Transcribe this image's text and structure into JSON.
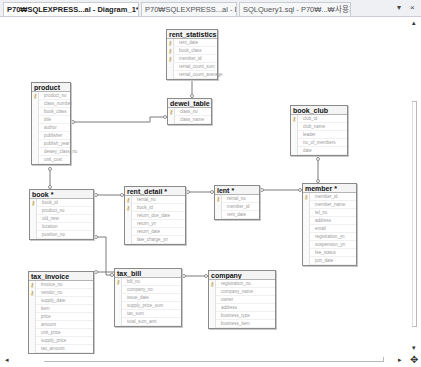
{
  "tabs": [
    {
      "label": "P70₩SQLEXPRESS...al - Diagram_1*",
      "active": true
    },
    {
      "label": "P70₩SQLEXPRESS...al - Diagram_0*",
      "active": false
    },
    {
      "label": "SQLQuery1.sql - P70₩...₩사용자...*",
      "active": false
    }
  ],
  "window_controls": {
    "dropdown": "▾",
    "close": "×"
  },
  "scrollbars": {
    "up": "▴",
    "left": "◂",
    "right": "▸",
    "down": "▾",
    "pan": "✥"
  },
  "colors": {
    "key": "#b8941e",
    "border": "#8a8a8a",
    "line": "#7a7a7a"
  },
  "tables": [
    {
      "name": "rent_statistics",
      "x": 166,
      "y": 29,
      "w": 52,
      "columns": [
        {
          "name": "rent_date",
          "key": true
        },
        {
          "name": "book_class",
          "key": true
        },
        {
          "name": "member_id",
          "key": true
        },
        {
          "name": "rental_count_sum",
          "key": false
        },
        {
          "name": "rental_count_average",
          "key": false
        }
      ]
    },
    {
      "name": "dewei_table",
      "x": 167,
      "y": 98,
      "w": 45,
      "columns": [
        {
          "name": "class_no",
          "key": true
        },
        {
          "name": "class_name",
          "key": false
        }
      ]
    },
    {
      "name": "product",
      "x": 31,
      "y": 82,
      "w": 40,
      "columns": [
        {
          "name": "product_no",
          "key": true
        },
        {
          "name": "class_number",
          "key": false
        },
        {
          "name": "book_class",
          "key": false
        },
        {
          "name": "title",
          "key": false
        },
        {
          "name": "author",
          "key": false
        },
        {
          "name": "publisher",
          "key": false
        },
        {
          "name": "publish_year",
          "key": false
        },
        {
          "name": "dewey_class_no",
          "key": false
        },
        {
          "name": "unit_cost",
          "key": false
        }
      ]
    },
    {
      "name": "book_club",
      "x": 290,
      "y": 105,
      "w": 58,
      "columns": [
        {
          "name": "club_id",
          "key": true
        },
        {
          "name": "club_name",
          "key": false
        },
        {
          "name": "leader",
          "key": false
        },
        {
          "name": "no_of_members",
          "key": false
        },
        {
          "name": "date",
          "key": false
        }
      ]
    },
    {
      "name": "book *",
      "x": 29,
      "y": 189,
      "w": 65,
      "columns": [
        {
          "name": "book_id",
          "key": true
        },
        {
          "name": "product_no",
          "key": false
        },
        {
          "name": "old_new",
          "key": false
        },
        {
          "name": "location",
          "key": false
        },
        {
          "name": "position_no",
          "key": false
        }
      ]
    },
    {
      "name": "rent_detail *",
      "x": 124,
      "y": 186,
      "w": 62,
      "columns": [
        {
          "name": "rental_no",
          "key": true
        },
        {
          "name": "book_id",
          "key": true
        },
        {
          "name": "return_due_date",
          "key": false
        },
        {
          "name": "return_yn",
          "key": false
        },
        {
          "name": "return_date",
          "key": false
        },
        {
          "name": "late_charge_yn",
          "key": false
        }
      ]
    },
    {
      "name": "lent *",
      "x": 214,
      "y": 185,
      "w": 46,
      "columns": [
        {
          "name": "rental_no",
          "key": true
        },
        {
          "name": "member_id",
          "key": false
        },
        {
          "name": "rent_date",
          "key": false
        }
      ]
    },
    {
      "name": "member *",
      "x": 302,
      "y": 183,
      "w": 55,
      "columns": [
        {
          "name": "member_id",
          "key": true
        },
        {
          "name": "member_name",
          "key": false
        },
        {
          "name": "tel_no",
          "key": false
        },
        {
          "name": "address",
          "key": false
        },
        {
          "name": "email",
          "key": false
        },
        {
          "name": "registration_yn",
          "key": false
        },
        {
          "name": "suspension_yn",
          "key": false
        },
        {
          "name": "fee_status",
          "key": false
        },
        {
          "name": "join_date",
          "key": false
        }
      ]
    },
    {
      "name": "tax_invoice",
      "x": 28,
      "y": 271,
      "w": 66,
      "columns": [
        {
          "name": "invoice_no",
          "key": true
        },
        {
          "name": "vendor_no",
          "key": true
        },
        {
          "name": "supply_date",
          "key": false
        },
        {
          "name": "item",
          "key": false
        },
        {
          "name": "price",
          "key": false
        },
        {
          "name": "amount",
          "key": false
        },
        {
          "name": "unit_price",
          "key": false
        },
        {
          "name": "supply_price",
          "key": false
        },
        {
          "name": "tax_amount",
          "key": false
        }
      ]
    },
    {
      "name": "tax_bill",
      "x": 114,
      "y": 268,
      "w": 68,
      "columns": [
        {
          "name": "bill_no",
          "key": true
        },
        {
          "name": "company_no",
          "key": false
        },
        {
          "name": "issue_date",
          "key": false
        },
        {
          "name": "supply_price_sum",
          "key": false
        },
        {
          "name": "tax_sum",
          "key": false
        },
        {
          "name": "total_sum_amt",
          "key": false
        }
      ]
    },
    {
      "name": "company",
      "x": 208,
      "y": 270,
      "w": 68,
      "columns": [
        {
          "name": "registration_no",
          "key": true
        },
        {
          "name": "company_name",
          "key": false
        },
        {
          "name": "owner",
          "key": false
        },
        {
          "name": "address",
          "key": false
        },
        {
          "name": "business_type",
          "key": false
        },
        {
          "name": "business_item",
          "key": false
        }
      ]
    }
  ]
}
